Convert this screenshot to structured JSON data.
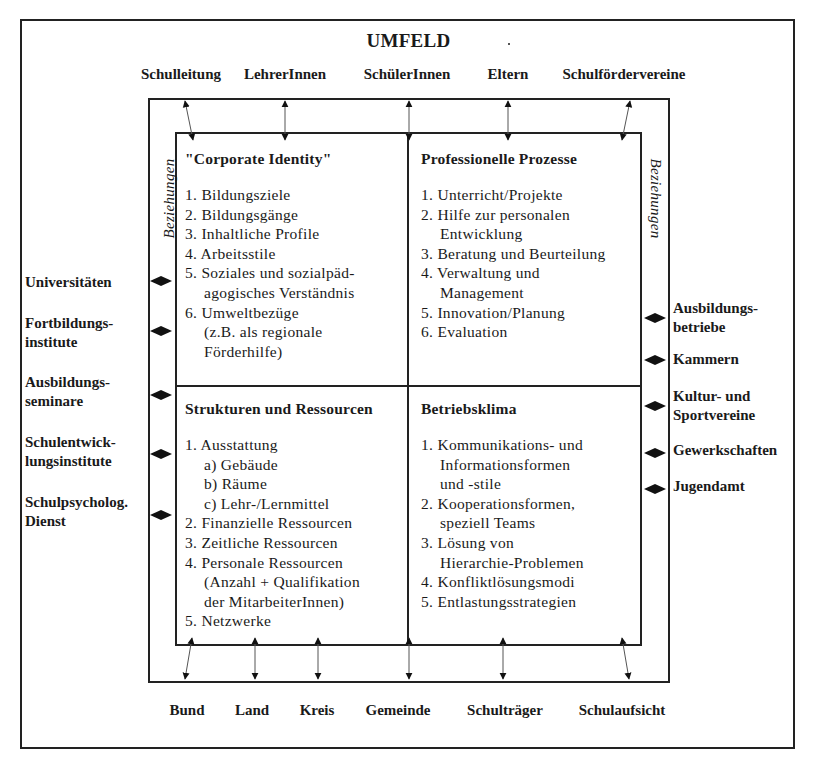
{
  "diagram": {
    "title": "UMFELD",
    "top_stakeholders": [
      "Schulleitung",
      "LehrerInnen",
      "SchülerInnen",
      "Eltern",
      "Schulfördervereine"
    ],
    "bottom_stakeholders": [
      "Bund",
      "Land",
      "Kreis",
      "Gemeinde",
      "Schulträger",
      "Schulaufsicht"
    ],
    "left_partners": [
      {
        "line1": "Universitäten",
        "line2": ""
      },
      {
        "line1": "Fortbildungs-",
        "line2": "institute"
      },
      {
        "line1": "Ausbildungs-",
        "line2": "seminare"
      },
      {
        "line1": "Schulentwick-",
        "line2": "lungsinstitute"
      },
      {
        "line1": "Schulpsycholog.",
        "line2": "Dienst"
      }
    ],
    "right_partners": [
      {
        "line1": "Ausbildungs-",
        "line2": "betriebe"
      },
      {
        "line1": "Kammern",
        "line2": ""
      },
      {
        "line1": "Kultur- und",
        "line2": "Sportvereine"
      },
      {
        "line1": "Gewerkschaften",
        "line2": ""
      },
      {
        "line1": "Jugendamt",
        "line2": ""
      }
    ],
    "relations_label_left": "Beziehungen",
    "relations_label_right": "Beziehungen",
    "quadrants": {
      "top_left": {
        "title": "\"Corporate Identity\"",
        "items": [
          "1. Bildungsziele",
          "2. Bildungsgänge",
          "3. Inhaltliche Profile",
          "4. Arbeitsstile",
          "5. Soziales und sozialpäd-",
          "agogisches Verständnis",
          "6. Umweltbezüge",
          "(z.B. als regionale",
          "Förderhilfe)"
        ]
      },
      "top_right": {
        "title": "Professionelle Prozesse",
        "items": [
          "1. Unterricht/Projekte",
          "2. Hilfe zur personalen",
          "Entwicklung",
          "3. Beratung und Beurteilung",
          "4. Verwaltung und",
          "Management",
          "5. Innovation/Planung",
          "6. Evaluation"
        ]
      },
      "bottom_left": {
        "title": "Strukturen und Ressourcen",
        "items": [
          "1. Ausstattung",
          "a) Gebäude",
          "b) Räume",
          "c) Lehr-/Lernmittel",
          "2. Finanzielle Ressourcen",
          "3. Zeitliche Ressourcen",
          "4. Personale Ressourcen",
          "(Anzahl + Qualifikation",
          "der MitarbeiterInnen)",
          "5. Netzwerke"
        ]
      },
      "bottom_right": {
        "title": "Betriebsklima",
        "items": [
          "1. Kommunikations- und",
          "Informationsformen",
          "und -stile",
          "2. Kooperationsformen,",
          "speziell Teams",
          "3. Lösung von",
          "Hierarchie-Problemen",
          "4. Konfliktlösungsmodi",
          "5. Entlastungsstrategien"
        ]
      }
    },
    "colors": {
      "line": "#222222",
      "text": "#1a1a1a",
      "background": "#ffffff"
    }
  }
}
